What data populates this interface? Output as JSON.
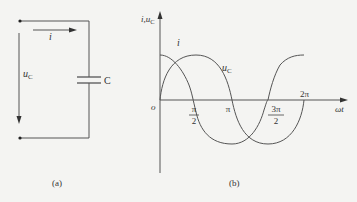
{
  "figure_a": {
    "caption": "(a)",
    "current_label": "i",
    "voltage_label": "u",
    "voltage_sub": "C",
    "capacitor_label": "C"
  },
  "figure_b": {
    "caption": "(b)",
    "y_axis_label": "i,u",
    "y_axis_sub": "C",
    "x_axis_label": "ωt",
    "origin_label": "o",
    "curve_i_label": "i",
    "curve_u_label": "u",
    "curve_u_sub": "C",
    "ticks": {
      "half_pi_num": "π",
      "half_pi_den": "2",
      "pi": "π",
      "three_half_pi_num": "3π",
      "three_half_pi_den": "2",
      "two_pi": "2π"
    }
  },
  "colors": {
    "line": "#555555",
    "text": "#333333",
    "background": "#f4f4f2"
  }
}
